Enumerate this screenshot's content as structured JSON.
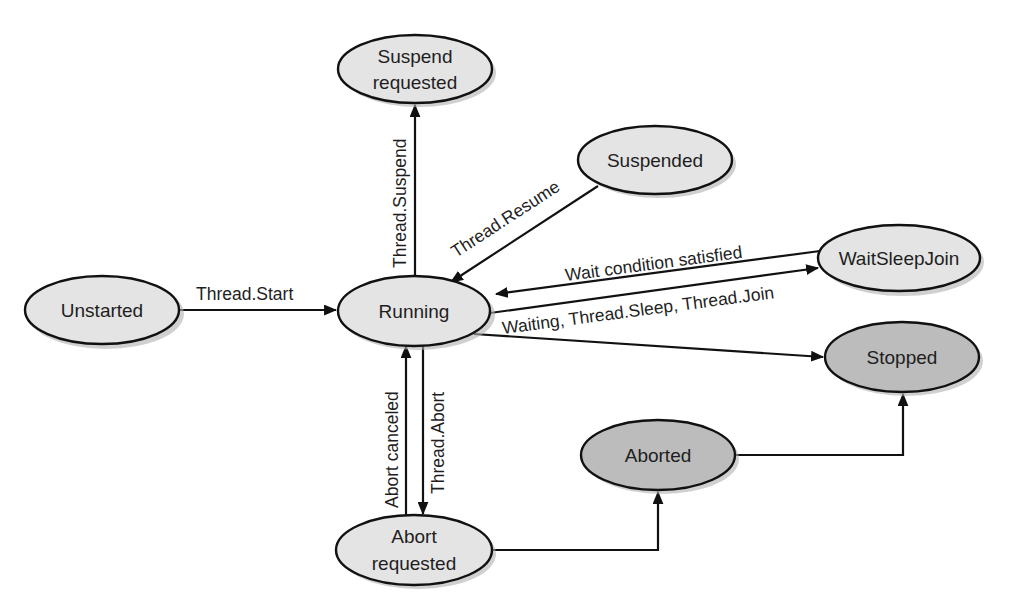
{
  "colors": {
    "background": "#ffffff",
    "state_fill_light": "#e4e4e4",
    "state_fill_dark": "#bcbcbc",
    "stroke": "#111111",
    "text": "#1e1e1e"
  },
  "states": {
    "unstarted": {
      "label": [
        "Unstarted"
      ],
      "fill": "light"
    },
    "running": {
      "label": [
        "Running"
      ],
      "fill": "light"
    },
    "suspend_requested": {
      "label": [
        "Suspend",
        "requested"
      ],
      "fill": "light"
    },
    "suspended": {
      "label": [
        "Suspended"
      ],
      "fill": "light"
    },
    "wait_sleep_join": {
      "label": [
        "WaitSleepJoin"
      ],
      "fill": "light"
    },
    "stopped": {
      "label": [
        "Stopped"
      ],
      "fill": "dark"
    },
    "aborted": {
      "label": [
        "Aborted"
      ],
      "fill": "dark"
    },
    "abort_requested": {
      "label": [
        "Abort",
        "requested"
      ],
      "fill": "light"
    }
  },
  "transitions": {
    "thread_start": {
      "label": "Thread.Start",
      "from": "Unstarted",
      "to": "Running"
    },
    "thread_suspend": {
      "label": "Thread.Suspend",
      "from": "Running",
      "to": "Suspend requested"
    },
    "thread_resume": {
      "label": "Thread.Resume",
      "from": "Suspended",
      "to": "Running"
    },
    "wait_condition_satisfied": {
      "label": "Wait condition satisfied",
      "from": "WaitSleepJoin",
      "to": "Running"
    },
    "waiting_sleep_join": {
      "label": "Waiting, Thread.Sleep, Thread.Join",
      "from": "Running",
      "to": "WaitSleepJoin"
    },
    "running_to_stopped": {
      "label": "",
      "from": "Running",
      "to": "Stopped"
    },
    "abort_canceled": {
      "label": "Abort canceled",
      "from": "Abort requested",
      "to": "Running"
    },
    "thread_abort": {
      "label": "Thread.Abort",
      "from": "Running",
      "to": "Abort requested"
    },
    "abort_requested_to_aborted": {
      "label": "",
      "from": "Abort requested",
      "to": "Aborted"
    },
    "aborted_to_stopped": {
      "label": "",
      "from": "Aborted",
      "to": "Stopped"
    }
  }
}
